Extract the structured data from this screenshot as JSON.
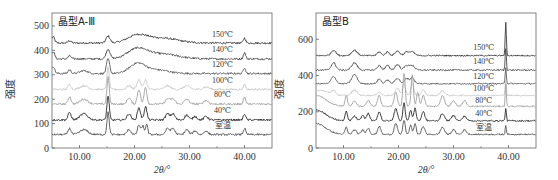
{
  "chart_data": [
    {
      "type": "line",
      "title": "晶型A-Ⅲ",
      "xlabel": "2θ/°",
      "ylabel": "强度",
      "xlim": [
        5,
        45
      ],
      "ylim": [
        0,
        553
      ],
      "x_ticks": [
        10,
        20,
        30,
        40
      ],
      "x_tick_labels": [
        "10.00",
        "20.00",
        "30.00",
        "40.00"
      ],
      "y_ticks": [
        0,
        100,
        200,
        300,
        400,
        500
      ],
      "y_tick_labels": [
        "0",
        "100",
        "200",
        "300",
        "400",
        "500"
      ],
      "legend": "inline-right",
      "grid": false,
      "series": [
        {
          "name": "150℃",
          "color": "#3a3a3a",
          "baseline": 430,
          "label_y": 465,
          "peaks": [
            [
              5.2,
              25,
              0.4
            ],
            [
              8.2,
              10,
              0.4
            ],
            [
              15.2,
              28,
              0.5
            ],
            [
              20.5,
              30,
              2.5
            ],
            [
              25,
              20,
              4
            ],
            [
              40.0,
              20,
              0.3
            ]
          ]
        },
        {
          "name": "140℃",
          "color": "#4a4a4a",
          "baseline": 365,
          "label_y": 405,
          "peaks": [
            [
              5.2,
              30,
              0.4
            ],
            [
              8.2,
              12,
              0.4
            ],
            [
              15.2,
              40,
              0.5
            ],
            [
              20.5,
              40,
              2.5
            ],
            [
              25,
              20,
              4
            ],
            [
              40.0,
              25,
              0.3
            ]
          ]
        },
        {
          "name": "120℃",
          "color": "#5a5a5a",
          "baseline": 305,
          "label_y": 345,
          "peaks": [
            [
              5.2,
              30,
              0.4
            ],
            [
              8.2,
              15,
              0.4
            ],
            [
              10.8,
              12,
              1
            ],
            [
              15.2,
              60,
              0.4
            ],
            [
              20.5,
              40,
              2.0
            ],
            [
              24,
              15,
              3
            ],
            [
              40.0,
              25,
              0.3
            ]
          ]
        },
        {
          "name": "100℃",
          "color": "#c8c8c8",
          "baseline": 240,
          "label_y": 280,
          "peaks": [
            [
              8.2,
              20,
              0.4
            ],
            [
              10.8,
              15,
              1
            ],
            [
              15.2,
              90,
              0.3
            ],
            [
              19,
              15,
              0.6
            ],
            [
              20.8,
              40,
              0.5
            ],
            [
              22,
              40,
              0.4
            ],
            [
              26,
              15,
              0.8
            ],
            [
              29.5,
              15,
              0.8
            ],
            [
              33,
              10,
              0.8
            ],
            [
              40.0,
              20,
              0.3
            ]
          ]
        },
        {
          "name": "80℃",
          "color": "#a0a0a0",
          "baseline": 180,
          "label_y": 220,
          "peaks": [
            [
              8.2,
              30,
              0.4
            ],
            [
              10.8,
              20,
              1
            ],
            [
              15.2,
              110,
              0.3
            ],
            [
              19,
              25,
              0.5
            ],
            [
              20.8,
              60,
              0.4
            ],
            [
              22,
              70,
              0.35
            ],
            [
              26,
              20,
              0.6
            ],
            [
              27,
              20,
              0.6
            ],
            [
              29.5,
              20,
              0.6
            ],
            [
              33,
              15,
              0.6
            ],
            [
              40.0,
              30,
              0.3
            ]
          ]
        },
        {
          "name": "40℃",
          "color": "#2a2a2a",
          "baseline": 115,
          "label_y": 155,
          "peaks": [
            [
              8.2,
              30,
              0.4
            ],
            [
              10.8,
              25,
              1
            ],
            [
              15.2,
              100,
              0.3
            ],
            [
              19,
              25,
              0.5
            ],
            [
              20.8,
              50,
              0.4
            ],
            [
              22,
              55,
              0.35
            ],
            [
              26,
              25,
              0.5
            ],
            [
              27,
              25,
              0.5
            ],
            [
              29.5,
              20,
              0.5
            ],
            [
              31,
              15,
              0.5
            ],
            [
              33,
              15,
              0.5
            ],
            [
              40.0,
              25,
              0.3
            ]
          ]
        },
        {
          "name": "室温",
          "color": "#555555",
          "baseline": 55,
          "label_y": 95,
          "peaks": [
            [
              8.2,
              25,
              0.4
            ],
            [
              10.8,
              20,
              1
            ],
            [
              15.2,
              90,
              0.3
            ],
            [
              19,
              20,
              0.5
            ],
            [
              20.8,
              40,
              0.35
            ],
            [
              21.5,
              35,
              0.3
            ],
            [
              22.2,
              40,
              0.3
            ],
            [
              26,
              25,
              0.5
            ],
            [
              27,
              25,
              0.5
            ],
            [
              29.5,
              20,
              0.5
            ],
            [
              31,
              15,
              0.5
            ],
            [
              33,
              15,
              0.5
            ],
            [
              40.0,
              25,
              0.3
            ]
          ]
        }
      ]
    },
    {
      "type": "line",
      "title": "晶型B",
      "xlabel": "2θ/°",
      "ylabel": "强度",
      "xlim": [
        5,
        45
      ],
      "ylim": [
        0,
        745
      ],
      "x_ticks": [
        10,
        20,
        30,
        40
      ],
      "x_tick_labels": [
        "10.00",
        "20.00",
        "30.00",
        "40.00"
      ],
      "y_ticks": [
        0,
        200,
        400,
        600
      ],
      "y_tick_labels": [
        "0",
        "200",
        "400",
        "600"
      ],
      "legend": "inline-right",
      "grid": false,
      "series": [
        {
          "name": "150℃",
          "color": "#3a3a3a",
          "baseline": 510,
          "label_y": 555,
          "peaks": [
            [
              8.2,
              30,
              0.6
            ],
            [
              12,
              30,
              0.7
            ],
            [
              16.5,
              20,
              0.5
            ],
            [
              18,
              20,
              0.5
            ],
            [
              19.8,
              25,
              0.6
            ],
            [
              21.5,
              20,
              0.6
            ],
            [
              22.5,
              20,
              0.6
            ],
            [
              39.5,
              180,
              0.15
            ]
          ]
        },
        {
          "name": "140℃",
          "color": "#4a4a4a",
          "baseline": 430,
          "label_y": 480,
          "peaks": [
            [
              8.2,
              40,
              0.6
            ],
            [
              12,
              40,
              0.7
            ],
            [
              16.5,
              25,
              0.5
            ],
            [
              18,
              25,
              0.5
            ],
            [
              19.8,
              30,
              0.6
            ],
            [
              21.5,
              25,
              0.6
            ],
            [
              22.5,
              25,
              0.6
            ],
            [
              39.5,
              120,
              0.15
            ]
          ]
        },
        {
          "name": "120℃",
          "color": "#5a5a5a",
          "baseline": 355,
          "label_y": 400,
          "peaks": [
            [
              8.2,
              40,
              0.6
            ],
            [
              12,
              50,
              0.7
            ],
            [
              16.5,
              25,
              0.5
            ],
            [
              18,
              20,
              0.5
            ],
            [
              19.8,
              30,
              0.6
            ],
            [
              21.5,
              30,
              0.5
            ],
            [
              22.5,
              35,
              0.5
            ],
            [
              39.5,
              90,
              0.15
            ]
          ]
        },
        {
          "name": "100℃",
          "color": "#c8c8c8",
          "baseline": 290,
          "label_y": 330,
          "peaks": [
            [
              6,
              30,
              1.5
            ],
            [
              8.2,
              25,
              0.6
            ],
            [
              12,
              30,
              0.7
            ],
            [
              16.5,
              20,
              0.5
            ],
            [
              19.8,
              40,
              0.5
            ],
            [
              21,
              60,
              0.4
            ],
            [
              22.5,
              60,
              0.4
            ],
            [
              24.5,
              30,
              0.5
            ],
            [
              28,
              25,
              0.6
            ],
            [
              39.5,
              90,
              0.15
            ]
          ]
        },
        {
          "name": "80℃",
          "color": "#a0a0a0",
          "baseline": 230,
          "label_y": 265,
          "peaks": [
            [
              5,
              60,
              2.5
            ],
            [
              10.5,
              60,
              0.3
            ],
            [
              12,
              30,
              0.5
            ],
            [
              14.5,
              30,
              0.5
            ],
            [
              16.5,
              60,
              0.4
            ],
            [
              19.5,
              80,
              0.4
            ],
            [
              21,
              180,
              0.3
            ],
            [
              22.5,
              170,
              0.3
            ],
            [
              23.5,
              80,
              0.3
            ],
            [
              24.5,
              60,
              0.4
            ],
            [
              28,
              60,
              0.5
            ],
            [
              30,
              30,
              0.5
            ],
            [
              32,
              30,
              0.5
            ],
            [
              39.5,
              120,
              0.15
            ]
          ]
        },
        {
          "name": "40℃",
          "color": "#2a2a2a",
          "baseline": 150,
          "label_y": 195,
          "peaks": [
            [
              5,
              60,
              2.5
            ],
            [
              10.5,
              50,
              0.3
            ],
            [
              12,
              25,
              0.5
            ],
            [
              13.5,
              30,
              0.4
            ],
            [
              14.5,
              40,
              0.4
            ],
            [
              16.5,
              50,
              0.4
            ],
            [
              19.5,
              70,
              0.4
            ],
            [
              21,
              100,
              0.3
            ],
            [
              22.2,
              60,
              0.3
            ],
            [
              23,
              70,
              0.3
            ],
            [
              24.5,
              50,
              0.4
            ],
            [
              28,
              40,
              0.5
            ],
            [
              30,
              30,
              0.5
            ],
            [
              32,
              25,
              0.5
            ],
            [
              39.5,
              70,
              0.15
            ]
          ]
        },
        {
          "name": "室温",
          "color": "#555555",
          "baseline": 75,
          "label_y": 115,
          "peaks": [
            [
              5,
              60,
              2.5
            ],
            [
              10.5,
              40,
              0.3
            ],
            [
              12,
              25,
              0.5
            ],
            [
              13.5,
              25,
              0.4
            ],
            [
              14.5,
              35,
              0.4
            ],
            [
              16.5,
              45,
              0.4
            ],
            [
              19.5,
              60,
              0.4
            ],
            [
              21,
              80,
              0.3
            ],
            [
              22.2,
              50,
              0.3
            ],
            [
              23,
              60,
              0.3
            ],
            [
              24.5,
              45,
              0.4
            ],
            [
              28,
              40,
              0.5
            ],
            [
              30,
              25,
              0.5
            ],
            [
              32,
              25,
              0.5
            ],
            [
              39.5,
              50,
              0.15
            ]
          ]
        }
      ]
    }
  ]
}
